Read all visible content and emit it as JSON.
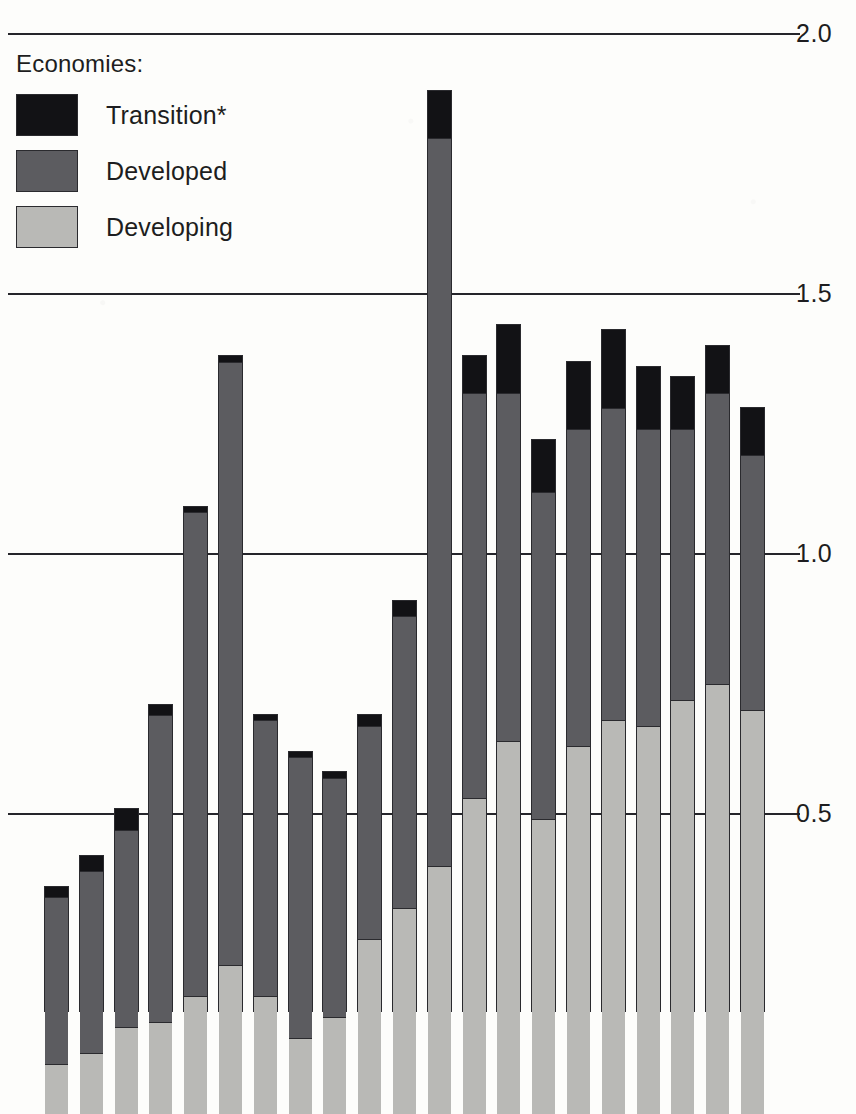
{
  "legend": {
    "title": "Economies:",
    "items": [
      {
        "label": "Transition*",
        "key": "transition",
        "color": "#121215"
      },
      {
        "label": "Developed",
        "key": "developed",
        "color": "#5c5c60"
      },
      {
        "label": "Developing",
        "key": "developing",
        "color": "#b9b9b6"
      }
    ]
  },
  "axis": {
    "ticks": [
      "2.0",
      "1.5",
      "1.0",
      "0.5"
    ],
    "tick_values": [
      2.0,
      1.5,
      1.0,
      0.5
    ]
  },
  "chart_data": {
    "type": "bar",
    "subtype": "stacked-vertical",
    "title": "",
    "subtitle": "",
    "xlabel": "",
    "ylabel": "",
    "ylim": [
      0,
      2.0
    ],
    "yticks": [
      0.5,
      1.0,
      1.5,
      2.0
    ],
    "ytick_labels": [
      "0.5",
      "1.0",
      "1.5",
      "2.0"
    ],
    "grid": true,
    "legend_position": "top-left",
    "axis_note": "Vertical axis values shown at right; zero baseline is cropped below the image edge.",
    "categories": [
      "1",
      "2",
      "3",
      "4",
      "5",
      "6",
      "7",
      "8",
      "9",
      "10",
      "11",
      "12",
      "13",
      "14",
      "15",
      "16",
      "17",
      "18",
      "19",
      "20",
      "21"
    ],
    "series": [
      {
        "name": "Developing",
        "color": "#b9b9b6",
        "values": [
          0.02,
          0.04,
          0.09,
          0.1,
          0.15,
          0.21,
          0.15,
          0.07,
          0.11,
          0.26,
          0.32,
          0.4,
          0.53,
          0.64,
          0.49,
          0.63,
          0.68,
          0.67,
          0.72,
          0.75,
          0.7
        ]
      },
      {
        "name": "Developed",
        "color": "#5c5c60",
        "values": [
          0.32,
          0.35,
          0.38,
          0.59,
          0.93,
          1.16,
          0.53,
          0.54,
          0.46,
          0.41,
          0.56,
          1.4,
          0.78,
          0.67,
          0.63,
          0.61,
          0.6,
          0.57,
          0.52,
          0.56,
          0.49
        ]
      },
      {
        "name": "Transition*",
        "color": "#121215",
        "values": [
          0.02,
          0.03,
          0.04,
          0.02,
          0.01,
          0.01,
          0.01,
          0.01,
          0.01,
          0.02,
          0.03,
          0.09,
          0.07,
          0.13,
          0.1,
          0.13,
          0.15,
          0.12,
          0.1,
          0.09,
          0.09
        ]
      }
    ],
    "totals": [
      0.36,
      0.42,
      0.51,
      0.71,
      1.09,
      1.38,
      0.69,
      0.62,
      0.58,
      0.69,
      0.91,
      1.89,
      1.38,
      1.44,
      1.22,
      1.37,
      1.43,
      1.36,
      1.34,
      1.4,
      1.28
    ]
  },
  "top_artifact": ""
}
